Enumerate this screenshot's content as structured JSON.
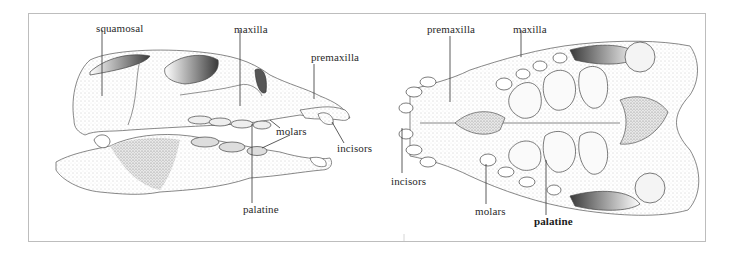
{
  "figure": {
    "panels": [
      {
        "id": "lateral-view",
        "labels": {
          "squamosal": "squamosal",
          "maxilla": "maxilla",
          "premaxilla": "premaxilla",
          "molars": "molars",
          "incisors": "incisors",
          "palatine": "palatine"
        }
      },
      {
        "id": "ventral-view",
        "labels": {
          "premaxilla": "premaxilla",
          "maxilla": "maxilla",
          "incisors": "incisors",
          "molars": "molars",
          "palatine": "palatine"
        }
      }
    ],
    "colors": {
      "frame": "#bdbdbd",
      "ink": "#2a2a2a",
      "shade": "#8a8a8a"
    }
  }
}
